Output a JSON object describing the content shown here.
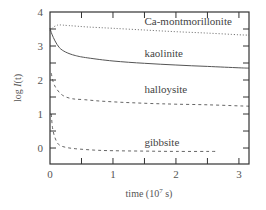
{
  "chart_data": {
    "type": "line",
    "title": "",
    "xlabel": "time (10^7 s)",
    "xlabel_parts": {
      "prefix": "time (10",
      "sup": "7",
      "suffix": " s)"
    },
    "ylabel": "log I(t)",
    "ylabel_parts": {
      "prefix": "log ",
      "italic": "I",
      "suffix": "(t)"
    },
    "xlim": [
      0,
      3.16
    ],
    "ylim": [
      -0.47,
      4
    ],
    "x_ticks": [
      0,
      1,
      2,
      3
    ],
    "y_ticks": [
      0,
      1,
      2,
      3,
      4
    ],
    "x_minor_step": 0.5,
    "y_minor_step": 0.5,
    "grid": false,
    "legend": "inline labels",
    "series": [
      {
        "name": "Ca-montmorillonite",
        "style": "dotted",
        "label_pos": [
          1.5,
          3.62
        ],
        "x": [
          0,
          0.05,
          0.1,
          0.15,
          0.3,
          0.6,
          1.0,
          1.5,
          2.0,
          2.5,
          3.0,
          3.16
        ],
        "y": [
          3.45,
          3.55,
          3.6,
          3.62,
          3.6,
          3.56,
          3.52,
          3.47,
          3.42,
          3.38,
          3.33,
          3.32
        ]
      },
      {
        "name": "kaolinite",
        "style": "solid",
        "label_pos": [
          1.5,
          2.68
        ],
        "x": [
          0,
          0.03,
          0.08,
          0.15,
          0.25,
          0.4,
          0.6,
          1.0,
          1.5,
          2.0,
          2.5,
          3.0,
          3.16
        ],
        "y": [
          3.52,
          3.35,
          3.15,
          2.95,
          2.82,
          2.72,
          2.65,
          2.56,
          2.49,
          2.44,
          2.4,
          2.36,
          2.35
        ]
      },
      {
        "name": "halloysite",
        "style": "dashed",
        "label_pos": [
          1.5,
          1.62
        ],
        "x": [
          0.02,
          0.05,
          0.1,
          0.2,
          0.35,
          0.55,
          0.8,
          1.2,
          1.6,
          2.0,
          2.5,
          3.0,
          3.16
        ],
        "y": [
          2.2,
          1.95,
          1.75,
          1.55,
          1.45,
          1.42,
          1.38,
          1.34,
          1.31,
          1.29,
          1.27,
          1.24,
          1.23
        ]
      },
      {
        "name": "gibbsite",
        "style": "dashed",
        "label_pos": [
          1.5,
          0.05
        ],
        "x": [
          0.02,
          0.04,
          0.08,
          0.14,
          0.25,
          0.4,
          0.7,
          1.0,
          1.5,
          2.0,
          2.65
        ],
        "y": [
          1.0,
          0.6,
          0.3,
          0.1,
          0.02,
          -0.02,
          -0.06,
          -0.08,
          -0.09,
          -0.1,
          -0.1
        ]
      }
    ]
  },
  "colors": {
    "axis": "#333333",
    "curve": "#555555"
  }
}
